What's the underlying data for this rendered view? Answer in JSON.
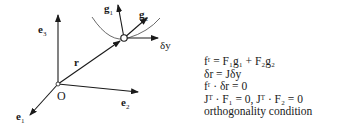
{
  "diagram": {
    "origin_label": "O",
    "vectors": {
      "e1": {
        "base": "e",
        "sub": "1"
      },
      "e2": {
        "base": "e",
        "sub": "2"
      },
      "e3": {
        "base": "e",
        "sub": "3"
      },
      "r": {
        "base": "r"
      },
      "g1": {
        "base": "g",
        "sub": "1"
      },
      "g2": {
        "base": "g",
        "sub": "2"
      },
      "dy": {
        "base": "δy"
      }
    }
  },
  "equations": [
    "fʳ = F₁g₁ + F₂g₂",
    "δr = Jδy",
    "fʳ · δr = 0",
    "Jᵀ · F₁ = 0, Jᵀ · F₂ = 0",
    "orthogonality condition"
  ]
}
